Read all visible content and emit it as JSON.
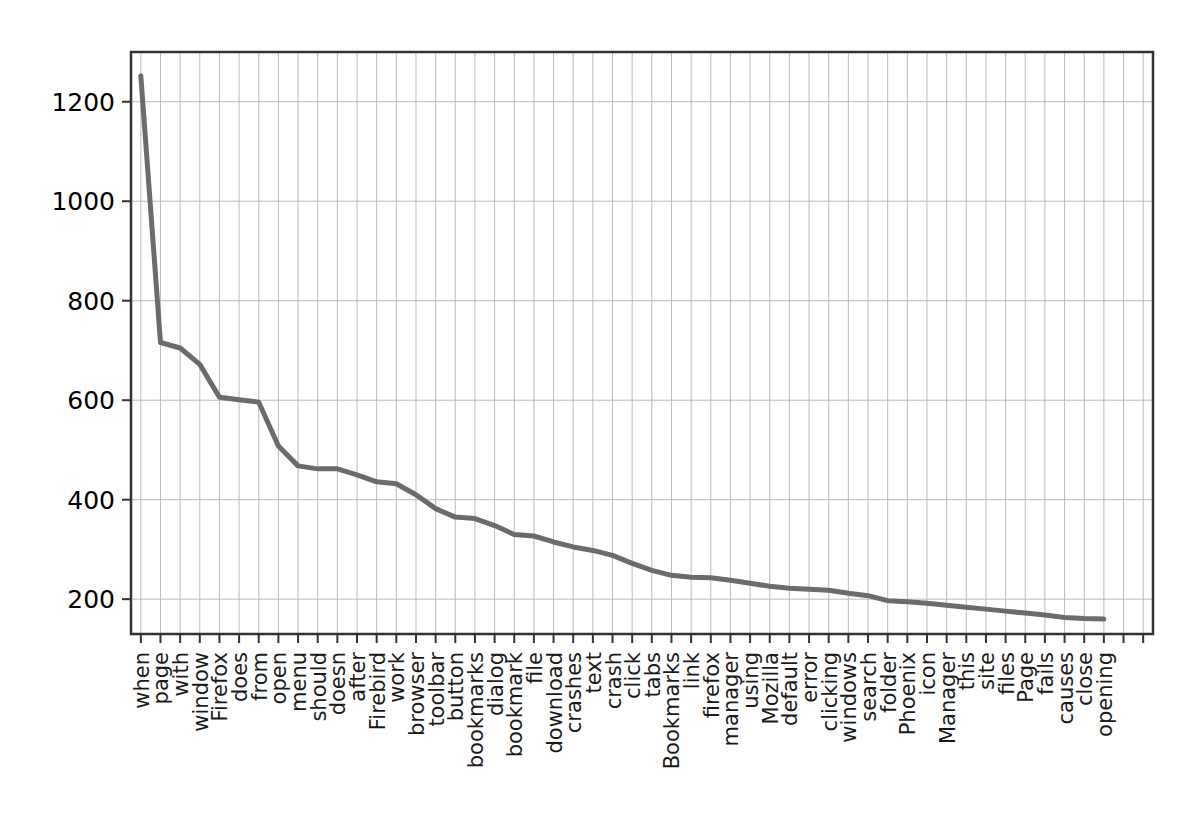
{
  "chart_data": {
    "type": "line",
    "title": "",
    "xlabel": "",
    "ylabel": "",
    "grid": true,
    "legend": "none",
    "line_color": "#6b6b6b",
    "grid_color": "#b0b0b0",
    "axis_color": "#333333",
    "xlim_index": [
      0,
      51
    ],
    "ylim": [
      130,
      1300
    ],
    "y_ticks": [
      200,
      400,
      600,
      800,
      1000,
      1200
    ],
    "x_tick_count": 52,
    "categories": [
      "when",
      "page",
      "with",
      "window",
      "Firefox",
      "does",
      "from",
      "open",
      "menu",
      "should",
      "doesn",
      "after",
      "Firebird",
      "work",
      "browser",
      "toolbar",
      "button",
      "bookmarks",
      "dialog",
      "bookmark",
      "file",
      "download",
      "crashes",
      "text",
      "crash",
      "click",
      "tabs",
      "Bookmarks",
      "link",
      "firefox",
      "manager",
      "using",
      "Mozilla",
      "default",
      "error",
      "clicking",
      "windows",
      "search",
      "folder",
      "Phoenix",
      "icon",
      "Manager",
      "this",
      "site",
      "files",
      "Page",
      "fails",
      "causes",
      "close",
      "opening"
    ],
    "values": [
      1252,
      716,
      705,
      672,
      606,
      601,
      596,
      508,
      468,
      462,
      462,
      450,
      436,
      432,
      410,
      382,
      365,
      362,
      348,
      330,
      327,
      315,
      305,
      298,
      288,
      272,
      258,
      248,
      244,
      243,
      238,
      232,
      226,
      222,
      220,
      218,
      212,
      207,
      197,
      195,
      192,
      188,
      184,
      180,
      176,
      172,
      168,
      163,
      161,
      160
    ]
  }
}
